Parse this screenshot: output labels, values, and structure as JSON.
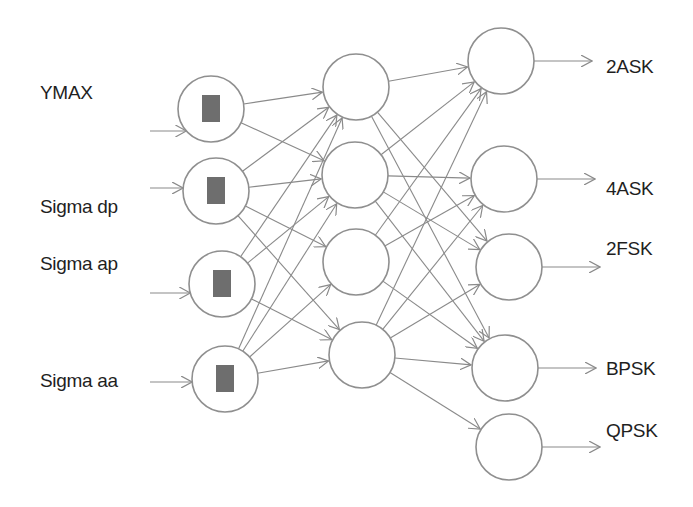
{
  "colors": {
    "line": "#8a8a8a",
    "node_stroke": "#8f8f8f",
    "box_fill": "#6e6e6e",
    "text": "#1f1f1f"
  },
  "inputs": [
    {
      "label": "ΥMAX"
    },
    {
      "label": "Sigma dp"
    },
    {
      "label": "Sigma ap"
    },
    {
      "label": "Sigma aa"
    }
  ],
  "hidden": [
    {},
    {},
    {},
    {}
  ],
  "outputs": [
    {
      "label": "2ASK"
    },
    {
      "label": "4ASK"
    },
    {
      "label": "2FSK"
    },
    {
      "label": "BPSK"
    },
    {
      "label": "QPSK"
    }
  ],
  "edges_input_hidden": [
    [
      0,
      0
    ],
    [
      0,
      1
    ],
    [
      1,
      0
    ],
    [
      1,
      1
    ],
    [
      1,
      2
    ],
    [
      1,
      3
    ],
    [
      2,
      0
    ],
    [
      2,
      1
    ],
    [
      2,
      3
    ],
    [
      3,
      0
    ],
    [
      3,
      1
    ],
    [
      3,
      2
    ],
    [
      3,
      3
    ]
  ],
  "edges_hidden_output": [
    [
      0,
      0
    ],
    [
      0,
      3
    ],
    [
      0,
      2
    ],
    [
      1,
      0
    ],
    [
      1,
      1
    ],
    [
      1,
      3
    ],
    [
      1,
      2
    ],
    [
      2,
      0
    ],
    [
      2,
      1
    ],
    [
      2,
      3
    ],
    [
      3,
      0
    ],
    [
      3,
      1
    ],
    [
      3,
      2
    ],
    [
      3,
      3
    ],
    [
      3,
      4
    ]
  ]
}
